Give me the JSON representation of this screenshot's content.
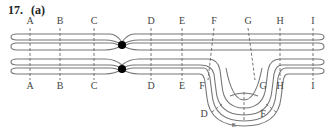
{
  "figure": {
    "problem_number": "17.",
    "part": "(a)"
  },
  "top_chromosome": {
    "labels": [
      "A",
      "B",
      "C",
      "D",
      "E",
      "F",
      "G",
      "H",
      "I"
    ]
  },
  "bottom_chromosome": {
    "labels_left": [
      "A",
      "B",
      "C",
      "D",
      "E",
      "F"
    ],
    "labels_right": [
      "G",
      "H",
      "I"
    ],
    "loop_labels": [
      "D",
      "E",
      "F"
    ]
  },
  "colors": {
    "strand": "#777777",
    "centromere": "#000000",
    "label": "#444444"
  }
}
